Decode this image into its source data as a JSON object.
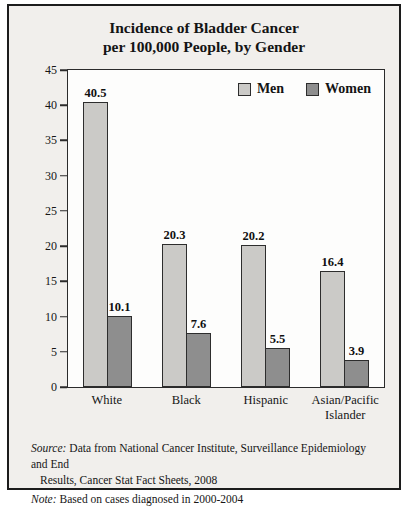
{
  "title": {
    "line1": "Incidence of Bladder Cancer",
    "line2": "per 100,000 People, by Gender"
  },
  "chart_data": {
    "type": "bar",
    "categories": [
      "White",
      "Black",
      "Hispanic",
      "Asian/Pacific Islander"
    ],
    "series": [
      {
        "name": "Men",
        "color": "#cbcac7",
        "values": [
          40.5,
          20.3,
          20.2,
          16.4
        ]
      },
      {
        "name": "Women",
        "color": "#8e8e8e",
        "values": [
          10.1,
          7.6,
          5.5,
          3.9
        ]
      }
    ],
    "title": "Incidence of Bladder Cancer per 100,000 People, by Gender",
    "xlabel": "",
    "ylabel": "",
    "ylim": [
      0,
      45
    ],
    "yticks": [
      45,
      40,
      35,
      30,
      25,
      20,
      15,
      10,
      5,
      0
    ],
    "grid": false,
    "legend_position": "top-right",
    "value_labels": true
  },
  "footer": {
    "source_label": "Source:",
    "source_line1": "Data from National Cancer Institute, Surveillance Epidemiology and End",
    "source_line2": "Results, Cancer Stat Fact Sheets, 2008",
    "note_label": "Note:",
    "note_text": "Based on cases diagnosed in 2000-2004"
  },
  "colors": {
    "panel_background": "#f1efec",
    "plot_background": "#fdfdfc",
    "border": "#1c1c1c",
    "men_bar": "#cbcac7",
    "women_bar": "#8e8e8e"
  }
}
